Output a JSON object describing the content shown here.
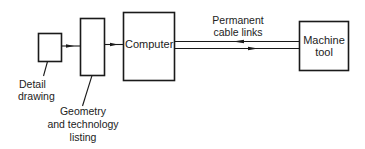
{
  "diagram": {
    "type": "block-flow-diagram",
    "nodes": {
      "detail_box": {
        "label": ""
      },
      "listing_box": {
        "label": ""
      },
      "computer": {
        "label": "Computer"
      },
      "machine_tool": {
        "line1": "Machine",
        "line2": "tool"
      }
    },
    "labels": {
      "detail_drawing": {
        "line1": "Detail",
        "line2": "drawing"
      },
      "geometry_listing": {
        "line1": "Geometry",
        "line2": "and technology",
        "line3": "listing"
      },
      "cable_links": {
        "line1": "Permanent",
        "line2": "cable links"
      }
    },
    "edges": [
      {
        "from": "detail_box",
        "to": "listing_box",
        "direction": "right"
      },
      {
        "from": "listing_box",
        "to": "computer",
        "direction": "right"
      },
      {
        "from": "machine_tool",
        "to": "computer",
        "direction": "left",
        "label": "Permanent cable links"
      },
      {
        "from": "computer",
        "to": "machine_tool",
        "direction": "right",
        "label": "Permanent cable links"
      }
    ],
    "colors": {
      "stroke": "#1a1a1a",
      "background": "#ffffff",
      "text": "#222222"
    }
  }
}
